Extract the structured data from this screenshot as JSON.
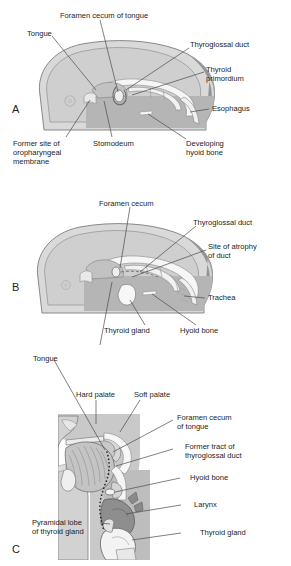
{
  "figure": {
    "title_visible": false,
    "panels": [
      {
        "id": "A",
        "letter": "A",
        "labels": [
          {
            "name": "foramen-cecum-of-tongue",
            "text": "Foramen cecum of tongue"
          },
          {
            "name": "tongue",
            "text": "Tongue"
          },
          {
            "name": "thyroglossal-duct",
            "text": "Thyroglossal duct"
          },
          {
            "name": "thyroid-primordium-line1",
            "text": "Thyroid"
          },
          {
            "name": "thyroid-primordium-line2",
            "text": "primordium"
          },
          {
            "name": "esophagus",
            "text": "Esophagus"
          },
          {
            "name": "former-site-line1",
            "text": "Former site of"
          },
          {
            "name": "former-site-line2",
            "text": "oropharyngeal"
          },
          {
            "name": "former-site-line3",
            "text": "membrane"
          },
          {
            "name": "stomodeum",
            "text": "Stomodeum"
          },
          {
            "name": "developing-hyoid-line1",
            "text": "Developing"
          },
          {
            "name": "developing-hyoid-line2",
            "text": "hyoid bone"
          }
        ]
      },
      {
        "id": "B",
        "letter": "B",
        "labels": [
          {
            "name": "foramen-cecum",
            "text": "Foramen cecum"
          },
          {
            "name": "thyroglossal-duct",
            "text": "Thyroglossal duct"
          },
          {
            "name": "site-of-atrophy-line1",
            "text": "Site of atrophy"
          },
          {
            "name": "site-of-atrophy-line2",
            "text": "of duct"
          },
          {
            "name": "trachea",
            "text": "Trachea"
          },
          {
            "name": "thyroid-gland",
            "text": "Thyroid gland"
          },
          {
            "name": "hyoid-bone",
            "text": "Hyoid bone"
          }
        ]
      },
      {
        "id": "C",
        "letter": "C",
        "labels": [
          {
            "name": "tongue",
            "text": "Tongue"
          },
          {
            "name": "hard-palate",
            "text": "Hard palate"
          },
          {
            "name": "soft-palate",
            "text": "Soft palate"
          },
          {
            "name": "foramen-cecum-line1",
            "text": "Foramen cecum"
          },
          {
            "name": "foramen-cecum-line2",
            "text": "of tongue"
          },
          {
            "name": "former-tract-line1",
            "text": "Former tract of"
          },
          {
            "name": "former-tract-line2",
            "text": "thyroglossal duct"
          },
          {
            "name": "hyoid-bone",
            "text": "Hyoid bone"
          },
          {
            "name": "larynx",
            "text": "Larynx"
          },
          {
            "name": "thyroid-gland",
            "text": "Thyroid gland"
          },
          {
            "name": "pyramidal-lobe-line1",
            "text": "Pyramidal lobe"
          },
          {
            "name": "pyramidal-lobe-line2",
            "text": "of thyroid gland"
          }
        ]
      }
    ],
    "colors": {
      "background": "#ffffff",
      "text": "#1d1d1d",
      "leader_line": "#4a4a4a",
      "tissue_light": "#d6d6d6",
      "tissue_mid": "#bdbdbd",
      "tissue_dark": "#9a9a9a",
      "tissue_darker": "#7e7e7e",
      "lumen_white": "#f7f7f7",
      "outline": "#6b6b6b"
    }
  }
}
